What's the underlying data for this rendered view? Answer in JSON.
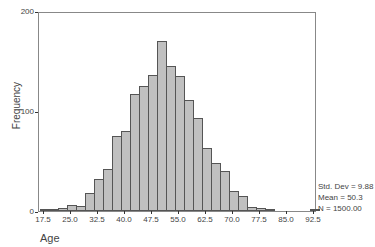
{
  "chart_data": {
    "type": "bar",
    "title": "",
    "xlabel": "Age",
    "ylabel": "Frequency",
    "ylim": [
      0,
      200
    ],
    "bin_width": 2.5,
    "yticks": [
      "0",
      "100",
      "200"
    ],
    "xticks": [
      "17.5",
      "25.0",
      "32.5",
      "40.0",
      "47.5",
      "55.0",
      "62.5",
      "70.0",
      "77.5",
      "85.0",
      "92.5"
    ],
    "categories": [
      "17.5",
      "20.0",
      "22.5",
      "25.0",
      "27.5",
      "30.0",
      "32.5",
      "35.0",
      "37.5",
      "40.0",
      "42.5",
      "45.0",
      "47.5",
      "50.0",
      "52.5",
      "55.0",
      "57.5",
      "60.0",
      "62.5",
      "65.0",
      "67.5",
      "70.0",
      "72.5",
      "75.0",
      "77.5",
      "80.0",
      "82.5",
      "85.0",
      "87.5",
      "90.0",
      "92.5"
    ],
    "values": [
      1,
      1,
      3,
      6,
      5,
      18,
      32,
      42,
      75,
      80,
      117,
      125,
      136,
      170,
      145,
      135,
      111,
      93,
      63,
      48,
      40,
      20,
      15,
      4,
      3,
      1,
      0,
      0,
      0,
      0,
      1
    ],
    "grid": false,
    "legend": null,
    "stats": {
      "std_dev": "Std. Dev = 9.88",
      "mean": "Mean = 50.3",
      "n": "N = 1500.00"
    }
  }
}
